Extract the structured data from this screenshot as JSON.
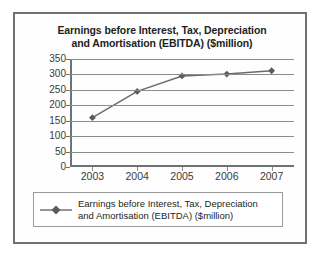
{
  "chart_data": {
    "type": "line",
    "title": "Earnings before Interest, Tax, Depreciation and Amortisation (EBITDA) ($million)",
    "title_line1": "Earnings before Interest, Tax, Depreciation",
    "title_line2": "and Amortisation (EBITDA) ($million)",
    "xlabel": "",
    "ylabel": "",
    "categories": [
      "2003",
      "2004",
      "2005",
      "2006",
      "2007"
    ],
    "values": [
      160,
      245,
      295,
      301,
      312
    ],
    "series": [
      {
        "name": "Earnings before Interest, Tax, Depreciation and Amortisation (EBITDA) ($million)",
        "values": [
          160,
          245,
          295,
          301,
          312
        ]
      }
    ],
    "ylim": [
      0,
      350
    ],
    "ytick_step": 50,
    "ytick_labels": [
      "350",
      "300",
      "250",
      "200",
      "150",
      "100",
      "50",
      "0"
    ],
    "ytick_values": [
      350,
      300,
      250,
      200,
      150,
      100,
      50,
      0
    ],
    "xtick_labels": [
      "2003",
      "2004",
      "2005",
      "2006",
      "2007"
    ],
    "grid": true,
    "grid_axis": "y",
    "legend_position": "bottom",
    "legend_entries": [
      {
        "label_line1": "Earnings before Interest, Tax, Depreciation",
        "label_line2": "and Amortisation (EBITDA) ($million)",
        "marker": "diamond"
      }
    ],
    "colors": {
      "series_line": "#6b6b6b",
      "series_marker": "#5a5a5a",
      "gridline": "#8c8c8c",
      "axis": "#6f7173",
      "title_text": "#231f20",
      "tick_text": "#3a3a3a",
      "frame_border": "#6f7173",
      "legend_border": "#9a9a9a",
      "background": "#ffffff"
    }
  }
}
